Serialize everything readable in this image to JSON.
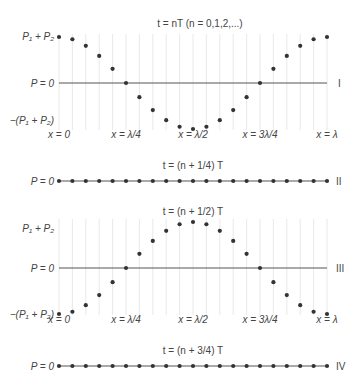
{
  "figure": {
    "x_start_px": 59,
    "x_end_px": 327,
    "num_points": 21,
    "colors": {
      "axis": "#555555",
      "dot": "#333333",
      "grid": "#e2e2e2",
      "text": "#444444"
    }
  },
  "x_labels": [
    {
      "text": "x = 0",
      "pos": 0
    },
    {
      "text": "x = λ/4",
      "pos": 5
    },
    {
      "text": "x = λ/2",
      "pos": 10
    },
    {
      "text": "x = 3λ/4",
      "pos": 15
    },
    {
      "text": "x = λ",
      "pos": 20
    }
  ],
  "panels": [
    {
      "id": "I",
      "roman": "I",
      "title": "t = nT (n = 0,1,2,...)",
      "phase": "cos",
      "axis_y": 83,
      "amplitude_px": 46,
      "show_grid": true,
      "show_x_labels": true,
      "labels": {
        "top": "P₁ + P₂",
        "zero": "P = 0",
        "bottom": "−(P₁ + P₂)"
      }
    },
    {
      "id": "II",
      "roman": "II",
      "title": "t = (n + 1/4) T",
      "phase": "zero",
      "axis_y": 181,
      "amplitude_px": 0,
      "show_grid": false,
      "show_x_labels": false,
      "labels": {
        "zero": "P = 0"
      }
    },
    {
      "id": "III",
      "roman": "III",
      "title": "t = (n + 1/2) T",
      "phase": "-cos",
      "axis_y": 268,
      "amplitude_px": 46,
      "show_grid": true,
      "show_x_labels": true,
      "labels": {
        "top": "P₁ + P₂",
        "zero": "P = 0",
        "bottom": "−(P₁ + P₂)"
      }
    },
    {
      "id": "IV",
      "roman": "IV",
      "title": "t = (n + 3/4) T",
      "phase": "zero",
      "axis_y": 366,
      "amplitude_px": 0,
      "show_grid": false,
      "show_x_labels": false,
      "labels": {
        "zero": "P = 0"
      }
    }
  ]
}
